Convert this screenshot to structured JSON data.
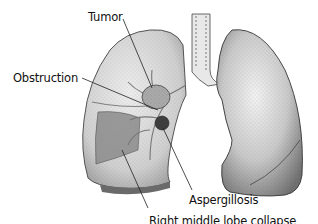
{
  "figure": {
    "labels": {
      "tumor": "Tumor",
      "obstruction": "Obstruction",
      "aspergillosis": "Aspergillosis",
      "right_middle_lobe": "Right middle lobe collapse"
    },
    "colors": {
      "background": "#ffffff",
      "lung_light": "#e6e6e6",
      "lung_mid": "#bdbdbd",
      "lung_dark": "#6e6e6e",
      "outline": "#333333",
      "leader_line": "#222222"
    }
  }
}
